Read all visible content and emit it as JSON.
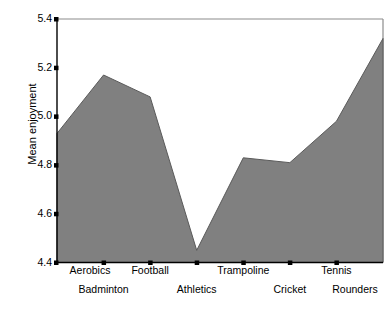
{
  "chart_data": {
    "type": "area",
    "title": "",
    "subtitle": "",
    "xlabel": "",
    "ylabel": "Mean enjoyment",
    "categories": [
      "Aerobics",
      "Badminton",
      "Football",
      "Athletics",
      "Trampoline",
      "Cricket",
      "Tennis",
      "Rounders"
    ],
    "values": [
      4.93,
      5.17,
      5.08,
      4.45,
      4.83,
      4.81,
      4.98,
      5.32
    ],
    "series": [
      {
        "name": "Mean enjoyment",
        "values": [
          4.93,
          5.17,
          5.08,
          4.45,
          4.83,
          4.81,
          4.98,
          5.32
        ]
      }
    ],
    "ylim": [
      4.4,
      5.4
    ],
    "yticks": [
      4.4,
      4.6,
      4.8,
      5.0,
      5.2,
      5.4
    ],
    "ytick_labels": [
      "4.4",
      "4.6",
      "4.8",
      "5.0",
      "5.2",
      "5.4"
    ],
    "grid": false,
    "legend": false,
    "legend_position": "none",
    "fill_color": "#808080",
    "line_color": "#595959",
    "axis_color": "#000000",
    "plot_background": "#ffffff",
    "xtick_layout": "staggered-two-row",
    "annotations": []
  },
  "axes": {
    "y_title": "Mean enjoyment",
    "y_ticks": [
      {
        "label": "5.4",
        "value": 5.4
      },
      {
        "label": "5.2",
        "value": 5.2
      },
      {
        "label": "5.0",
        "value": 5.0
      },
      {
        "label": "4.8",
        "value": 4.8
      },
      {
        "label": "4.6",
        "value": 4.6
      },
      {
        "label": "4.4",
        "value": 4.4
      }
    ],
    "x_ticks": [
      {
        "label": "Aerobics",
        "row": "top"
      },
      {
        "label": "Badminton",
        "row": "bottom"
      },
      {
        "label": "Football",
        "row": "top"
      },
      {
        "label": "Athletics",
        "row": "bottom"
      },
      {
        "label": "Trampoline",
        "row": "top"
      },
      {
        "label": "Cricket",
        "row": "bottom"
      },
      {
        "label": "Tennis",
        "row": "top"
      },
      {
        "label": "Rounders",
        "row": "bottom"
      }
    ]
  }
}
